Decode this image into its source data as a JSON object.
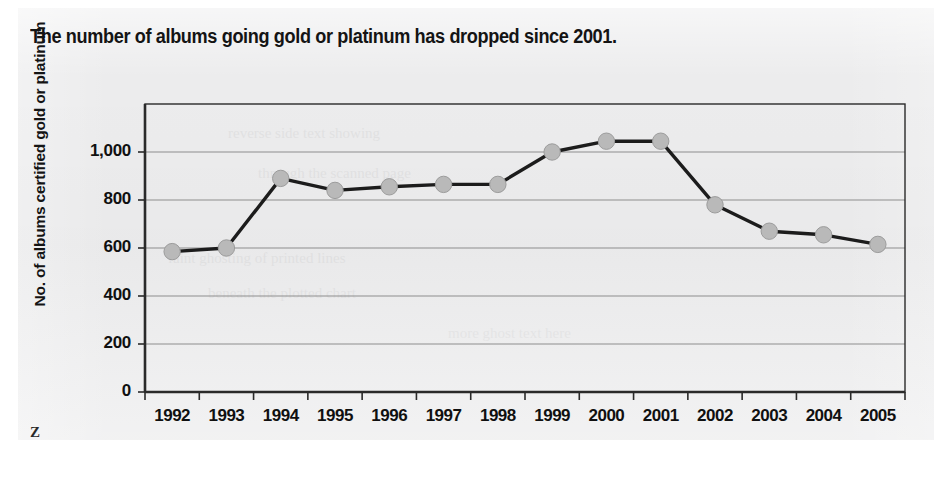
{
  "figure": {
    "title": "The number of albums going gold or platinum has dropped since 2001.",
    "corner_mark": "Z",
    "paper_color": "#ececed",
    "line_color": "#1c1c1c",
    "marker_color": "#b9b9b9",
    "marker_edge_color": "#9c9c9c",
    "grid_color": "#8d8d8d",
    "axis_color": "#2a2a2a",
    "text_color": "#101010"
  },
  "chart_data": {
    "type": "line",
    "title": "The number of albums going gold or platinum has dropped since 2001.",
    "xlabel": "",
    "ylabel": "No. of albums certified gold or platinum",
    "categories": [
      "1992",
      "1993",
      "1994",
      "1995",
      "1996",
      "1997",
      "1998",
      "1999",
      "2000",
      "2001",
      "2002",
      "2003",
      "2004",
      "2005"
    ],
    "values": [
      585,
      600,
      890,
      840,
      855,
      865,
      865,
      1000,
      1045,
      1045,
      780,
      670,
      655,
      615
    ],
    "series": [
      {
        "name": "No. of albums certified gold or platinum",
        "values": [
          585,
          600,
          890,
          840,
          855,
          865,
          865,
          1000,
          1045,
          1045,
          780,
          670,
          655,
          615
        ]
      }
    ],
    "ylim": [
      0,
      1200
    ],
    "yticks": [
      0,
      200,
      400,
      600,
      800,
      1000
    ],
    "ytick_labels": [
      "0",
      "200",
      "400",
      "600",
      "800",
      "1,000"
    ],
    "xtick_labels": [
      "1992",
      "1993",
      "1994",
      "1995",
      "1996",
      "1997",
      "1998",
      "1999",
      "2000",
      "2001",
      "2002",
      "2003",
      "2004",
      "2005"
    ],
    "grid": true,
    "grid_axis": "y",
    "legend": false,
    "legend_position": "none",
    "markers": "circle",
    "annotations": []
  }
}
